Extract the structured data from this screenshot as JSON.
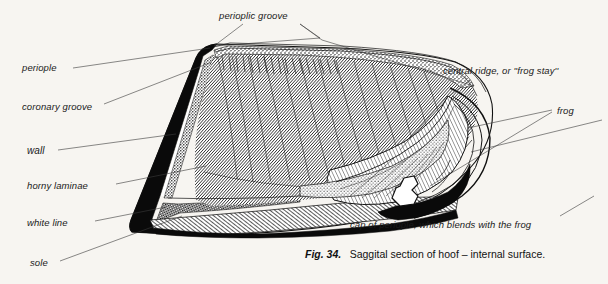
{
  "figure": {
    "title": "Saggital section of hoof – internal surface.",
    "number": "Fig. 34.",
    "caption_text": "Saggital section of hoof – internal surface.",
    "background_color": "#f7f5f1",
    "ink_color": "#111111"
  },
  "labels": {
    "perioplic_groove": "perioplic groove",
    "periople": "periople",
    "coronary_groove": "coronary groove",
    "wall": "wall",
    "horny_laminae": "horny laminae",
    "white_line": "white line",
    "sole": "sole",
    "central_ridge": "central ridge, or ''frog stay''",
    "frog": "frog",
    "cap_of_periople": "cap of periople, which blends with the frog"
  },
  "label_positions": {
    "perioplic_groove": {
      "x": 219,
      "y": 19,
      "anchor": "start"
    },
    "periople": {
      "x": 22,
      "y": 71,
      "anchor": "start"
    },
    "coronary_groove": {
      "x": 22,
      "y": 110,
      "anchor": "start"
    },
    "wall": {
      "x": 27,
      "y": 154,
      "anchor": "start"
    },
    "horny_laminae": {
      "x": 27,
      "y": 189,
      "anchor": "start"
    },
    "white_line": {
      "x": 27,
      "y": 226,
      "anchor": "start"
    },
    "sole": {
      "x": 30,
      "y": 266,
      "anchor": "start"
    },
    "central_ridge": {
      "x": 443,
      "y": 74,
      "anchor": "start"
    },
    "frog": {
      "x": 557,
      "y": 114,
      "anchor": "start"
    },
    "cap_of_periople": {
      "x": 350,
      "y": 228,
      "anchor": "start"
    },
    "caption": {
      "x": 305,
      "y": 258,
      "anchor": "start"
    }
  },
  "anatomy_parts": [
    {
      "name": "perioplic groove",
      "region": "top margin narrow band"
    },
    {
      "name": "periople",
      "region": "upper toe band"
    },
    {
      "name": "coronary groove",
      "region": "stippled band along coronary border"
    },
    {
      "name": "wall",
      "region": "solid black toe wall"
    },
    {
      "name": "horny laminae",
      "region": "fine diagonal hatching of inner wall"
    },
    {
      "name": "white line",
      "region": "checkered band at toe bottom"
    },
    {
      "name": "sole",
      "region": "hatched band along ground surface"
    },
    {
      "name": "central ridge, or ''frog stay''",
      "region": "raised central ridge of frog"
    },
    {
      "name": "frog",
      "region": "bulbous heel structure at right"
    },
    {
      "name": "cap of periople",
      "region": "heel bulb blending into frog"
    }
  ]
}
